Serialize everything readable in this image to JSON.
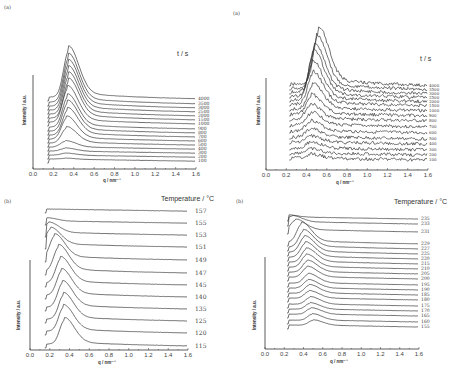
{
  "chart_data": [
    {
      "id": "top-left",
      "type": "line",
      "panel_label": "(a)",
      "title": "",
      "xlabel": "q / nm⁻¹",
      "ylabel": "Intensity / a.u.",
      "legend_title": "t / s",
      "xticks": [
        "0.0",
        "0.2",
        "0.4",
        "0.6",
        "0.8",
        "1.0",
        "1.2",
        "1.4",
        "1.6"
      ],
      "xlim": [
        0.0,
        1.6
      ],
      "x_start": 0.14,
      "series_labels": [
        "4000",
        "3500",
        "3000",
        "2500",
        "2000",
        "1500",
        "1000",
        "900",
        "800",
        "700",
        "600",
        "500",
        "400",
        "300",
        "200",
        "100"
      ],
      "peak_q": [
        0.35,
        0.35,
        0.35,
        0.35,
        0.35,
        0.35,
        0.34,
        0.34,
        0.34,
        0.34,
        0.33,
        0.33,
        0.32,
        0.32,
        0.32,
        0.32
      ],
      "peak_height": [
        46,
        44,
        42,
        40,
        38,
        36,
        33,
        30,
        28,
        25,
        21,
        15,
        6,
        3,
        2,
        1
      ],
      "noise": "smooth",
      "layout": {
        "x0": 33,
        "x1": 196,
        "ybase": 169,
        "ytop": 75,
        "offsets": [
          97,
          102,
          106,
          110,
          114,
          118,
          122,
          127,
          131,
          135,
          139,
          143,
          147,
          151,
          155,
          159
        ],
        "label_x": 198,
        "font": 4.5
      }
    },
    {
      "id": "top-right",
      "type": "line",
      "panel_label": "(a)",
      "title": "",
      "xlabel": "q / nm⁻¹",
      "ylabel": "Intensity / a.u.",
      "legend_title": "t / s",
      "xticks": [
        "0.0",
        "0.2",
        "0.4",
        "0.6",
        "0.8",
        "1.0",
        "1.2",
        "1.4",
        "1.6"
      ],
      "xlim": [
        0.0,
        1.6
      ],
      "x_start": 0.23,
      "series_labels": [
        "4000",
        "3500",
        "3000",
        "2500",
        "2000",
        "1500",
        "1000",
        "900",
        "800",
        "700",
        "600",
        "500",
        "400",
        "300",
        "200",
        "100"
      ],
      "peak_q": [
        0.52,
        0.5,
        0.48,
        0.47,
        0.46,
        0.46,
        0.46,
        0.45,
        0.44,
        0.45,
        0.44,
        0.44,
        0.44,
        0.44,
        0.44,
        0.44
      ],
      "peak_height": [
        52,
        48,
        44,
        42,
        36,
        30,
        24,
        18,
        14,
        12,
        10,
        8,
        6,
        6,
        4,
        4
      ],
      "noise": "rough",
      "layout": {
        "x0": 266,
        "x1": 428,
        "ybase": 170,
        "ytop": 78,
        "offsets": [
          84,
          88,
          92,
          96,
          100,
          104,
          109,
          114,
          119,
          125,
          131,
          137,
          142,
          148,
          153,
          158
        ],
        "label_x": 429,
        "font": 4
      }
    },
    {
      "id": "bottom-left",
      "type": "line",
      "panel_label": "(b)",
      "title": "",
      "xlabel": "q / nm⁻¹",
      "ylabel": "Intensity / a.u.",
      "legend_title": "Temperature / °C",
      "xticks": [
        "0.0",
        "0.2",
        "0.4",
        "0.6",
        "0.8",
        "1.0",
        "1.2",
        "1.4",
        "1.6"
      ],
      "xlim": [
        0.0,
        1.6
      ],
      "x_start": 0.15,
      "series_labels": [
        "157",
        "155",
        "153",
        "151",
        "149",
        "147",
        "145",
        "140",
        "135",
        "125",
        "120",
        "115"
      ],
      "peak_q": [
        0.15,
        0.17,
        0.19,
        0.21,
        0.25,
        0.29,
        0.31,
        0.32,
        0.33,
        0.34,
        0.34,
        0.35
      ],
      "peak_height": [
        0,
        3,
        10,
        16,
        22,
        24,
        24,
        24,
        24,
        24,
        24,
        24
      ],
      "noise": "smooth",
      "layout": {
        "x0": 30,
        "x1": 188,
        "ybase": 350,
        "ytop": 260,
        "offsets": [
          209,
          221,
          233,
          245,
          258,
          271,
          283,
          295,
          307,
          319,
          331,
          344
        ],
        "label_x": 195,
        "font": 6
      }
    },
    {
      "id": "bottom-right",
      "type": "line",
      "panel_label": "(b)",
      "title": "",
      "xlabel": "q / nm⁻¹",
      "ylabel": "Intensity / a.u.",
      "legend_title": "Temperature / °C",
      "xticks": [
        "0.0",
        "0.2",
        "0.4",
        "0.6",
        "0.8",
        "1.0",
        "1.2",
        "1.4",
        "1.6"
      ],
      "xlim": [
        0.0,
        1.6
      ],
      "x_start": 0.23,
      "series_labels": [
        "235",
        "233",
        "231",
        "229",
        "227",
        "225",
        "220",
        "215",
        "210",
        "205",
        "200",
        "195",
        "190",
        "185",
        "180",
        "175",
        "170",
        "165",
        "160",
        "155"
      ],
      "peak_q": [
        0.23,
        0.28,
        0.32,
        0.38,
        0.4,
        0.41,
        0.42,
        0.43,
        0.43,
        0.44,
        0.44,
        0.45,
        0.45,
        0.46,
        0.46,
        0.47,
        0.47,
        0.48,
        0.49,
        0.5
      ],
      "peak_height": [
        2,
        6,
        10,
        18,
        16,
        15,
        14,
        13,
        12,
        11,
        10,
        9,
        8,
        8,
        7,
        7,
        6,
        6,
        6,
        5
      ],
      "noise": "smooth",
      "layout": {
        "x0": 265,
        "x1": 419,
        "ybase": 349,
        "ytop": 257,
        "offsets": [
          217,
          222,
          230,
          242,
          247,
          252,
          257,
          262,
          267,
          272,
          277,
          283,
          288,
          293,
          298,
          304,
          309,
          314,
          320,
          325
        ],
        "label_x": 421,
        "font": 4.6
      }
    }
  ]
}
